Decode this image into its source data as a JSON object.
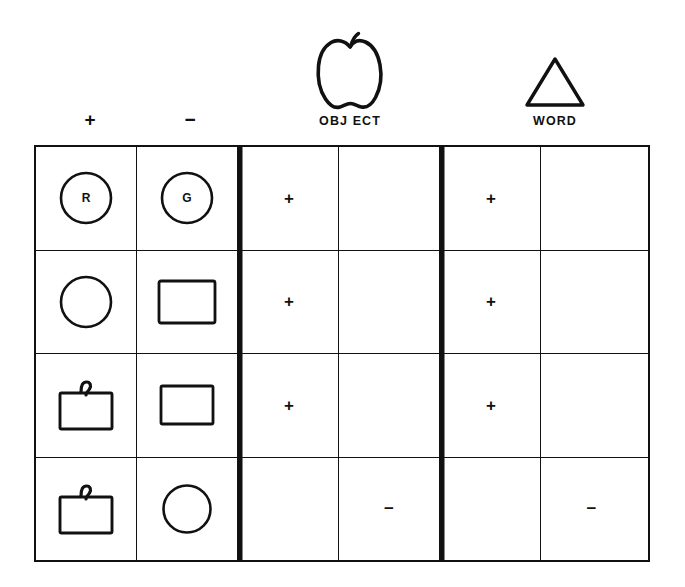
{
  "figure": {
    "ink_color": "#111111",
    "background_color": "#ffffff"
  },
  "legend": {
    "stimulus_headers": [
      {
        "name": "positive-stimulus-header",
        "label": "+"
      },
      {
        "name": "negative-stimulus-header",
        "label": "−"
      }
    ],
    "groups": [
      {
        "name": "object-group",
        "icon": "apple-outline-icon",
        "caption": "OBJ ECT"
      },
      {
        "name": "word-group",
        "icon": "triangle-outline-icon",
        "caption": "WORD"
      }
    ]
  },
  "matrix": {
    "columns": [
      {
        "key": "pos_stimulus",
        "header": "+",
        "type": "stimulus"
      },
      {
        "key": "neg_stimulus",
        "header": "−",
        "type": "stimulus"
      },
      {
        "key": "object_pos",
        "header": "OBJECT +",
        "type": "response"
      },
      {
        "key": "object_neg",
        "header": "OBJECT −",
        "type": "response"
      },
      {
        "key": "word_pos",
        "header": "WORD +",
        "type": "response"
      },
      {
        "key": "word_neg",
        "header": "WORD −",
        "type": "response"
      }
    ],
    "rows": [
      {
        "name": "row-1",
        "pos_stimulus": {
          "shape": "circle-with-letter",
          "letter": "R"
        },
        "neg_stimulus": {
          "shape": "circle-with-letter",
          "letter": "G"
        },
        "object_pos": "+",
        "object_neg": "",
        "word_pos": "+",
        "word_neg": ""
      },
      {
        "name": "row-2",
        "pos_stimulus": {
          "shape": "circle-plain",
          "letter": ""
        },
        "neg_stimulus": {
          "shape": "rectangle-plain",
          "letter": ""
        },
        "object_pos": "+",
        "object_neg": "",
        "word_pos": "+",
        "word_neg": ""
      },
      {
        "name": "row-3",
        "pos_stimulus": {
          "shape": "rectangle-with-hook",
          "letter": ""
        },
        "neg_stimulus": {
          "shape": "rectangle-plain",
          "letter": ""
        },
        "object_pos": "+",
        "object_neg": "",
        "word_pos": "+",
        "word_neg": ""
      },
      {
        "name": "row-4",
        "pos_stimulus": {
          "shape": "rectangle-with-hook",
          "letter": ""
        },
        "neg_stimulus": {
          "shape": "circle-plain",
          "letter": ""
        },
        "object_pos": "",
        "object_neg": "−",
        "word_pos": "",
        "word_neg": "−"
      }
    ]
  }
}
